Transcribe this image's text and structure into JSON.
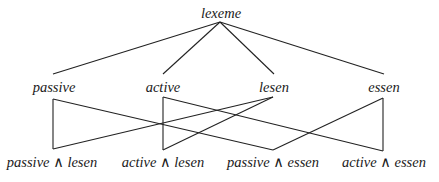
{
  "diagram": {
    "type": "lattice",
    "root": {
      "id": "lexeme",
      "label": "lexeme",
      "x": 221,
      "y": 18,
      "anchor": [
        220,
        22
      ]
    },
    "middle": [
      {
        "id": "passive",
        "label": "passive",
        "x": 54,
        "y": 92,
        "top": [
          53,
          74
        ],
        "bottom": [
          53,
          99
        ]
      },
      {
        "id": "active",
        "label": "active",
        "x": 163,
        "y": 92,
        "top": [
          163,
          74
        ],
        "bottom": [
          163,
          97
        ]
      },
      {
        "id": "lesen",
        "label": "lesen",
        "x": 274,
        "y": 92,
        "top": [
          274,
          74
        ],
        "bottom": [
          273,
          97
        ]
      },
      {
        "id": "essen",
        "label": "essen",
        "x": 384,
        "y": 92,
        "top": [
          384,
          74
        ],
        "bottom": [
          383,
          98
        ]
      }
    ],
    "leaves": [
      {
        "id": "passive_lesen",
        "label": "passive ∧ lesen",
        "x": 52,
        "y": 167,
        "top": [
          53,
          149
        ]
      },
      {
        "id": "active_lesen",
        "label": "active ∧ lesen",
        "x": 163,
        "y": 167,
        "top": [
          163,
          150
        ]
      },
      {
        "id": "passive_essen",
        "label": "passive ∧ essen",
        "x": 273,
        "y": 167,
        "top": [
          273,
          150
        ]
      },
      {
        "id": "active_essen",
        "label": "active ∧ essen",
        "x": 384,
        "y": 167,
        "top": [
          383,
          151
        ]
      }
    ],
    "edges": [
      {
        "from": "lexeme",
        "to": "passive"
      },
      {
        "from": "lexeme",
        "to": "active"
      },
      {
        "from": "lexeme",
        "to": "lesen"
      },
      {
        "from": "lexeme",
        "to": "essen"
      },
      {
        "from": "passive",
        "to": "passive_lesen"
      },
      {
        "from": "passive",
        "to": "passive_essen"
      },
      {
        "from": "active",
        "to": "active_lesen"
      },
      {
        "from": "active",
        "to": "active_essen"
      },
      {
        "from": "lesen",
        "to": "passive_lesen"
      },
      {
        "from": "lesen",
        "to": "active_lesen"
      },
      {
        "from": "essen",
        "to": "passive_essen"
      },
      {
        "from": "essen",
        "to": "active_essen"
      }
    ]
  }
}
